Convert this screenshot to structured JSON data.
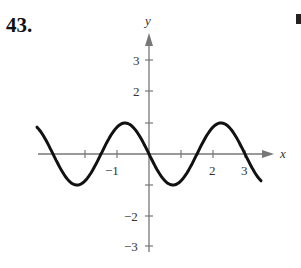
{
  "problem_number": "43.",
  "chart_data": {
    "type": "line",
    "title": "",
    "xlabel": "x",
    "ylabel": "y",
    "function_estimate": "y = -sin(2*pi*x/3)",
    "xlim": [
      -3.5,
      3.8
    ],
    "ylim": [
      -3.4,
      3.7
    ],
    "x_ticks": [
      -2,
      -1,
      1,
      2,
      3
    ],
    "x_tick_labels": [
      "-1",
      "2",
      "3"
    ],
    "x_tick_label_values": [
      -1,
      2,
      3
    ],
    "y_ticks": [
      3,
      2,
      1,
      -1,
      -2,
      -3
    ],
    "y_tick_labels": [
      "3",
      "2",
      "-2",
      "-3"
    ],
    "y_tick_label_values": [
      3,
      2,
      -2,
      -3
    ],
    "grid": false,
    "series": [
      {
        "name": "curve",
        "x": [
          -3.5,
          -3.0,
          -2.25,
          -1.5,
          -0.75,
          0,
          0.75,
          1.5,
          2.25,
          3.0,
          3.5
        ],
        "values": [
          0.87,
          0,
          -1,
          0,
          1,
          0,
          -1,
          0,
          1,
          0,
          -0.87
        ]
      }
    ],
    "colors": {
      "axis": "#777777",
      "curve": "#111111"
    }
  },
  "labels": {
    "x_axis": "x",
    "y_axis": "y",
    "xt_m1": "−1",
    "xt_2": "2",
    "xt_3": "3",
    "yt_3": "3",
    "yt_2": "2",
    "yt_m2": "−2",
    "yt_m3": "−3"
  }
}
